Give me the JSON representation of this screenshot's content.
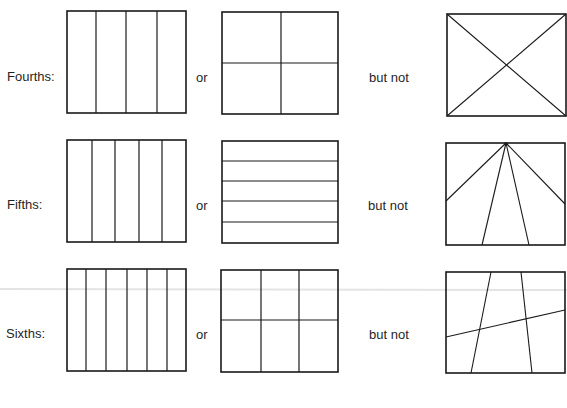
{
  "rows": [
    {
      "label": "Fourths:",
      "connector": "or",
      "contrast": "but not",
      "label_pos": [
        7,
        69
      ],
      "or_pos": [
        196,
        70
      ],
      "butnot_pos": [
        369,
        70
      ],
      "examples": [
        {
          "box": [
            67,
            11,
            186,
            113
          ],
          "verticals": [
            96,
            126,
            157
          ],
          "horizontals": []
        },
        {
          "box": [
            222,
            12,
            338,
            114
          ],
          "verticals": [
            281
          ],
          "horizontals": [
            63
          ]
        }
      ],
      "counterexample": {
        "box": [
          447,
          14,
          566,
          116
        ],
        "lines": [
          [
            447,
            14,
            566,
            116
          ],
          [
            566,
            14,
            447,
            116
          ]
        ]
      }
    },
    {
      "label": "Fifths:",
      "connector": "or",
      "contrast": "but not",
      "label_pos": [
        7,
        197
      ],
      "or_pos": [
        196,
        198
      ],
      "butnot_pos": [
        368,
        198
      ],
      "examples": [
        {
          "box": [
            67,
            140,
            186,
            242
          ],
          "verticals": [
            92,
            115,
            139,
            162
          ],
          "horizontals": []
        },
        {
          "box": [
            222,
            141,
            338,
            243
          ],
          "verticals": [],
          "horizontals": [
            161,
            181,
            201,
            222
          ]
        }
      ],
      "counterexample": {
        "box": [
          446,
          143,
          565,
          245
        ],
        "lines": [
          [
            506,
            143,
            446,
            201
          ],
          [
            506,
            143,
            565,
            204
          ],
          [
            506,
            143,
            482,
            245
          ],
          [
            506,
            143,
            529,
            245
          ]
        ]
      }
    },
    {
      "label": "Sixths:",
      "connector": "or",
      "contrast": "but not",
      "label_pos": [
        6,
        326
      ],
      "or_pos": [
        196,
        327
      ],
      "butnot_pos": [
        369,
        327
      ],
      "examples": [
        {
          "box": [
            67,
            269,
            186,
            371
          ],
          "verticals": [
            86,
            106,
            127,
            147,
            167
          ],
          "horizontals": []
        },
        {
          "box": [
            221,
            270,
            338,
            372
          ],
          "verticals": [
            261,
            299
          ],
          "horizontals": [
            320
          ]
        }
      ],
      "counterexample": {
        "box": [
          446,
          272,
          565,
          373
        ],
        "lines": [
          [
            491,
            272,
            471,
            373
          ],
          [
            521,
            272,
            532,
            373
          ],
          [
            446,
            337,
            565,
            310
          ]
        ]
      }
    }
  ],
  "colors": {
    "stroke": "#1a1a1a",
    "scan_line": "#e4e4e4",
    "background": "#ffffff"
  },
  "scan_artifact_y": 289
}
